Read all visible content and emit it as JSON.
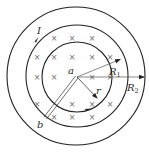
{
  "figure": {
    "labels": {
      "current": "I",
      "center": "a",
      "point_b": "b",
      "radius_r": "r",
      "radius_R1": "R",
      "radius_R1_sub": "1",
      "radius_R2": "R",
      "radius_R2_sub": "2"
    },
    "field_symbol": "×",
    "colors": {
      "stroke": "#222222",
      "field_mark": "#6a6a6a",
      "background": "#ffffff"
    },
    "circles": [
      {
        "name": "inner-circle",
        "cx": 77,
        "cy": 77,
        "r": 35
      },
      {
        "name": "middle-circle",
        "cx": 77,
        "cy": 76,
        "r": 51
      },
      {
        "name": "outer-circle",
        "cx": 76,
        "cy": 76,
        "r": 69
      }
    ],
    "field_marks": [
      [
        54,
        38
      ],
      [
        72,
        38
      ],
      [
        92,
        38
      ],
      [
        37,
        57
      ],
      [
        54,
        57
      ],
      [
        72,
        57
      ],
      [
        92,
        57
      ],
      [
        110,
        57
      ],
      [
        37,
        77
      ],
      [
        54,
        77
      ],
      [
        92,
        77
      ],
      [
        110,
        77
      ],
      [
        37,
        104
      ],
      [
        72,
        104
      ],
      [
        92,
        104
      ],
      [
        110,
        104
      ],
      [
        54,
        117
      ],
      [
        72,
        117
      ],
      [
        92,
        117
      ]
    ]
  }
}
